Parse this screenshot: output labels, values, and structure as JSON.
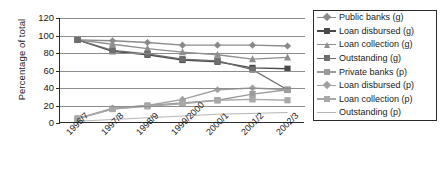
{
  "chart_data": {
    "type": "line",
    "title": "",
    "xlabel": "",
    "ylabel": "Percentage of total",
    "categories": [
      "1996/7",
      "1997/8",
      "1998/9",
      "1999/2000",
      "2000/1",
      "2001/2",
      "2002/3"
    ],
    "ylim": [
      0,
      120
    ],
    "yticks": [
      0,
      20,
      40,
      60,
      80,
      100,
      120
    ],
    "grid": true,
    "legend_position": "right",
    "series": [
      {
        "name": "Public banks (g)",
        "marker": "diamond",
        "color": "#8a8a8a",
        "values": [
          95,
          94,
          92,
          89,
          89,
          89,
          88
        ]
      },
      {
        "name": "Loan disbursed (g)",
        "marker": "square",
        "color": "#4a4a4a",
        "values": [
          95,
          82,
          78,
          72,
          70,
          63,
          62
        ]
      },
      {
        "name": "Loan collection (g)",
        "marker": "triangle",
        "color": "#8f8f8f",
        "values": [
          95,
          90,
          85,
          81,
          78,
          73,
          75
        ]
      },
      {
        "name": "Outstanding (g)",
        "marker": "square",
        "color": "#6e6e6e",
        "values": [
          95,
          83,
          79,
          73,
          71,
          61,
          38
        ]
      },
      {
        "name": "Private banks (p)",
        "marker": "square",
        "color": "#9a9a9a",
        "values": [
          5,
          16,
          20,
          23,
          26,
          33,
          38
        ]
      },
      {
        "name": "Loan disbursed (p)",
        "marker": "diamond",
        "color": "#a0a0a0",
        "values": [
          5,
          17,
          20,
          27,
          38,
          40,
          38
        ]
      },
      {
        "name": "Loan collection (p)",
        "marker": "square",
        "color": "#a8a8a8",
        "values": [
          5,
          16,
          19,
          22,
          26,
          27,
          26
        ]
      },
      {
        "name": "Outstanding (p)",
        "marker": "none",
        "color": "#b5b5b5",
        "values": [
          2,
          4,
          6,
          8,
          10,
          11,
          12
        ]
      }
    ]
  },
  "legend": {
    "items": [
      {
        "label": "Public banks (g)"
      },
      {
        "label": "Loan disbursed (g)"
      },
      {
        "label": "Loan collection (g)"
      },
      {
        "label": "Outstanding (g)"
      },
      {
        "label": "Private banks (p)"
      },
      {
        "label": "Loan disbursed (p)"
      },
      {
        "label": "Loan collection (p)"
      },
      {
        "label": "Outstanding (p)"
      }
    ]
  }
}
